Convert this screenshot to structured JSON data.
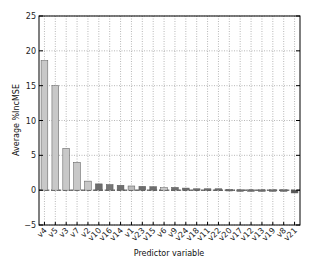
{
  "chart_data": {
    "type": "bar",
    "title": "",
    "xlabel": "Predictor variable",
    "ylabel": "Average %IncMSE",
    "ylim": [
      -5,
      25
    ],
    "yticks": [
      -5,
      0,
      5,
      10,
      15,
      20,
      25
    ],
    "grid": true,
    "legend": null,
    "categories": [
      "v4",
      "v5",
      "v3",
      "v7",
      "v2",
      "v10",
      "v16",
      "v14",
      "v1",
      "v23",
      "v15",
      "v6",
      "v9",
      "v24",
      "v18",
      "v11",
      "v22",
      "v20",
      "v17",
      "v12",
      "v13",
      "v19",
      "v8",
      "v21"
    ],
    "values": [
      18.6,
      15.0,
      6.0,
      4.0,
      1.3,
      0.9,
      0.8,
      0.7,
      0.6,
      0.55,
      0.5,
      0.35,
      0.4,
      0.3,
      0.2,
      0.2,
      0.2,
      0.1,
      0.05,
      0.05,
      0.05,
      0.05,
      0.05,
      -0.4
    ],
    "bar_colors": [
      "#c8c8c8",
      "#c8c8c8",
      "#c8c8c8",
      "#c8c8c8",
      "#c8c8c8",
      "#6e6e6e",
      "#777777",
      "#707070",
      "#bdbdbd",
      "#6e6e6e",
      "#6e6e6e",
      "#c8c8c8",
      "#707070",
      "#6e6e6e",
      "#6e6e6e",
      "#6e6e6e",
      "#6e6e6e",
      "#6e6e6e",
      "#6e6e6e",
      "#6e6e6e",
      "#6e6e6e",
      "#6e6e6e",
      "#6e6e6e",
      "#555555"
    ]
  }
}
